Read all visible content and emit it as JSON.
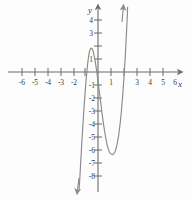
{
  "figure": {
    "axis_labels": {
      "x": "x",
      "y": "y"
    },
    "colors": {
      "axis": "#6b6b6b",
      "curve": "#8a8a8a",
      "tick_label": "#3c3c3c",
      "background": "#fdfdfd"
    }
  },
  "chart_data": {
    "type": "line",
    "title": "",
    "xlabel": "x",
    "ylabel": "y",
    "grid": false,
    "legend": null,
    "xlim": [
      -7,
      7
    ],
    "ylim": [
      -9,
      5
    ],
    "xticks": [
      -6,
      -5,
      -4,
      -3,
      -2,
      -1,
      0,
      1,
      2,
      3,
      4,
      5,
      6
    ],
    "yticks": [
      -8,
      -7,
      -6,
      -5,
      -4,
      -3,
      -2,
      -1,
      0,
      1,
      2,
      3,
      4
    ],
    "xtick_labels": [
      "-6",
      "-5",
      "-4",
      "-3",
      "-2",
      "",
      "",
      "1",
      "",
      "3",
      "4",
      "5",
      "6"
    ],
    "ytick_labels": [
      "-8",
      "-7",
      "-6",
      "-5",
      "-4",
      "-3",
      "-2",
      "-1",
      "",
      "1",
      "",
      "3",
      "4"
    ],
    "visible_xtick_labels": [
      "-6",
      "-5",
      "-4",
      "-3",
      "-2",
      "1",
      "3",
      "4",
      "5",
      "6"
    ],
    "visible_ytick_labels": [
      "4",
      "3",
      "1",
      "-1",
      "-2",
      "-3",
      "-4",
      "-5",
      "-6",
      "-7",
      "-8"
    ],
    "series": [
      {
        "name": "polynomial",
        "arrow_start": "down",
        "arrow_end": "up",
        "points": [
          [
            -1.45,
            -9.0
          ],
          [
            -1.4,
            -8.2
          ],
          [
            -1.35,
            -7.3
          ],
          [
            -1.3,
            -6.4
          ],
          [
            -1.25,
            -5.5
          ],
          [
            -1.2,
            -4.7
          ],
          [
            -1.15,
            -3.9
          ],
          [
            -1.1,
            -3.1
          ],
          [
            -1.05,
            -2.4
          ],
          [
            -1.0,
            -1.7
          ],
          [
            -0.95,
            -1.05
          ],
          [
            -0.9,
            -0.45
          ],
          [
            -0.85,
            0.1
          ],
          [
            -0.8,
            0.6
          ],
          [
            -0.75,
            1.0
          ],
          [
            -0.7,
            1.35
          ],
          [
            -0.65,
            1.6
          ],
          [
            -0.6,
            1.75
          ],
          [
            -0.55,
            1.83
          ],
          [
            -0.5,
            1.84
          ],
          [
            -0.45,
            1.79
          ],
          [
            -0.4,
            1.68
          ],
          [
            -0.35,
            1.5
          ],
          [
            -0.3,
            1.28
          ],
          [
            -0.25,
            1.02
          ],
          [
            -0.2,
            0.72
          ],
          [
            -0.15,
            0.4
          ],
          [
            -0.1,
            0.05
          ],
          [
            -0.05,
            -0.3
          ],
          [
            0.0,
            -0.7
          ],
          [
            0.1,
            -1.5
          ],
          [
            0.2,
            -2.3
          ],
          [
            0.3,
            -3.1
          ],
          [
            0.4,
            -3.85
          ],
          [
            0.5,
            -4.5
          ],
          [
            0.6,
            -5.1
          ],
          [
            0.7,
            -5.6
          ],
          [
            0.8,
            -5.95
          ],
          [
            0.9,
            -6.2
          ],
          [
            1.0,
            -6.3
          ],
          [
            1.1,
            -6.35
          ],
          [
            1.2,
            -6.3
          ],
          [
            1.3,
            -6.15
          ],
          [
            1.4,
            -5.85
          ],
          [
            1.5,
            -5.4
          ],
          [
            1.6,
            -4.8
          ],
          [
            1.7,
            -4.0
          ],
          [
            1.8,
            -3.0
          ],
          [
            1.9,
            -1.8
          ],
          [
            2.0,
            -0.4
          ],
          [
            2.08,
            0.9
          ],
          [
            2.15,
            2.2
          ],
          [
            2.22,
            3.6
          ],
          [
            2.28,
            5.0
          ]
        ],
        "local_maximum": [
          -0.5,
          1.84
        ],
        "local_minimum": [
          1.1,
          -6.35
        ],
        "x_intercepts": [
          -0.85,
          -0.1,
          2.03
        ]
      }
    ]
  }
}
